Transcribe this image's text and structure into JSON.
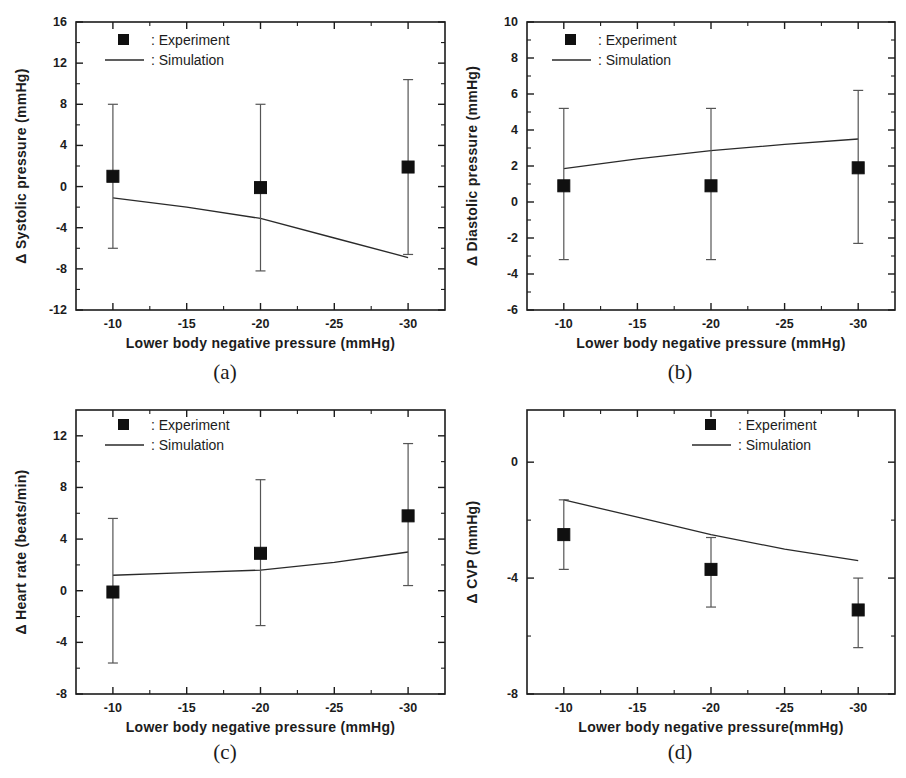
{
  "figure": {
    "width": 906,
    "height": 778,
    "background": "#ffffff",
    "ink_color": "#1c1c1c"
  },
  "legend": {
    "experiment_label": ": Experiment",
    "simulation_label": ": Simulation",
    "experiment_marker": "filled-square-marker",
    "simulation_marker": "solid-line-marker"
  },
  "captions": {
    "a": "(a)",
    "b": "(b)",
    "c": "(c)",
    "d": "(d)"
  },
  "chart_data": [
    {
      "id": "panel-a",
      "type": "scatter",
      "title": "",
      "caption": "(a)",
      "xlabel": "Lower body negative pressure (mmHg)",
      "ylabel": "Δ Systolic pressure (mmHg)",
      "x": [
        -10,
        -20,
        -30
      ],
      "xlim": [
        -7.5,
        -32.5
      ],
      "ylim": [
        -12,
        16
      ],
      "xticks": [
        -10,
        -15,
        -20,
        -25,
        -30
      ],
      "xticklabels": [
        "-10",
        "-15",
        "-20",
        "-25",
        "-30"
      ],
      "yticks": [
        -12,
        -8,
        -4,
        0,
        4,
        8,
        12,
        16
      ],
      "yticklabels": [
        "-12",
        "-8",
        "-4",
        "0",
        "4",
        "8",
        "12",
        "16"
      ],
      "y_minor_step": 2,
      "x_minor_step": 2.5,
      "grid": false,
      "legend_position": "top-left",
      "series": [
        {
          "name": "Experiment",
          "type": "scatter-errorbar",
          "values": [
            1.0,
            -0.1,
            1.9
          ],
          "err_low": [
            7.0,
            8.1,
            8.7
          ],
          "err_high": [
            7.0,
            8.1,
            8.5
          ],
          "lower": [
            -6.0,
            -8.2,
            -6.6
          ],
          "upper": [
            8.0,
            8.0,
            10.4
          ]
        },
        {
          "name": "Simulation",
          "type": "line",
          "x": [
            -10,
            -15,
            -20,
            -25,
            -30
          ],
          "values": [
            -1.1,
            -2.0,
            -3.1,
            -5.0,
            -6.9
          ]
        }
      ]
    },
    {
      "id": "panel-b",
      "type": "scatter",
      "title": "",
      "caption": "(b)",
      "xlabel": "Lower body negative pressure (mmHg)",
      "ylabel": "Δ Diastolic pressure (mmHg)",
      "x": [
        -10,
        -20,
        -30
      ],
      "xlim": [
        -7.5,
        -32.5
      ],
      "ylim": [
        -6,
        10
      ],
      "xticks": [
        -10,
        -15,
        -20,
        -25,
        -30
      ],
      "xticklabels": [
        "-10",
        "-15",
        "-20",
        "-25",
        "-30"
      ],
      "yticks": [
        -6,
        -4,
        -2,
        0,
        2,
        4,
        6,
        8,
        10
      ],
      "yticklabels": [
        "-6",
        "-4",
        "-2",
        "0",
        "2",
        "4",
        "6",
        "8",
        "10"
      ],
      "y_minor_step": 1,
      "x_minor_step": 2.5,
      "grid": false,
      "legend_position": "top-left",
      "series": [
        {
          "name": "Experiment",
          "type": "scatter-errorbar",
          "values": [
            0.9,
            0.9,
            1.9
          ],
          "err_low": [
            4.1,
            4.1,
            4.2
          ],
          "err_high": [
            4.3,
            4.3,
            4.3
          ],
          "lower": [
            -3.2,
            -3.2,
            -2.3
          ],
          "upper": [
            5.2,
            5.2,
            6.2
          ]
        },
        {
          "name": "Simulation",
          "type": "line",
          "x": [
            -10,
            -15,
            -20,
            -25,
            -30
          ],
          "values": [
            1.85,
            2.4,
            2.85,
            3.2,
            3.5
          ]
        }
      ]
    },
    {
      "id": "panel-c",
      "type": "scatter",
      "title": "",
      "caption": "(c)",
      "xlabel": "Lower body negative pressure (mmHg)",
      "ylabel": "Δ Heart rate (beats/min)",
      "x": [
        -10,
        -20,
        -30
      ],
      "xlim": [
        -7.5,
        -32.5
      ],
      "ylim": [
        -8,
        14
      ],
      "xticks": [
        -10,
        -15,
        -20,
        -25,
        -30
      ],
      "xticklabels": [
        "-10",
        "-15",
        "-20",
        "-25",
        "-30"
      ],
      "yticks": [
        -8,
        -4,
        0,
        4,
        8,
        12
      ],
      "yticklabels": [
        "-8",
        "-4",
        "0",
        "4",
        "8",
        "12"
      ],
      "y_minor_step": 2,
      "x_minor_step": 2.5,
      "grid": false,
      "legend_position": "top-left",
      "series": [
        {
          "name": "Experiment",
          "type": "scatter-errorbar",
          "values": [
            -0.1,
            2.9,
            5.8
          ],
          "err_low": [
            5.5,
            5.6,
            5.2
          ],
          "err_high": [
            5.7,
            5.7,
            5.5
          ],
          "lower": [
            -5.6,
            -2.7,
            0.4
          ],
          "upper": [
            5.6,
            8.6,
            11.4
          ]
        },
        {
          "name": "Simulation",
          "type": "line",
          "x": [
            -10,
            -15,
            -20,
            -25,
            -30
          ],
          "values": [
            1.2,
            1.4,
            1.6,
            2.2,
            3.0
          ]
        }
      ]
    },
    {
      "id": "panel-d",
      "type": "scatter",
      "title": "",
      "caption": "(d)",
      "xlabel": "Lower body negative pressure(mmHg)",
      "ylabel": "Δ CVP (mmHg)",
      "x": [
        -10,
        -20,
        -30
      ],
      "xlim": [
        -7.5,
        -32.5
      ],
      "ylim": [
        -8,
        1.8
      ],
      "xticks": [
        -10,
        -15,
        -20,
        -25,
        -30
      ],
      "xticklabels": [
        "-10",
        "-15",
        "-20",
        "-25",
        "-30"
      ],
      "yticks": [
        -8,
        -4,
        0
      ],
      "yticklabels": [
        "-8",
        "-4",
        "0"
      ],
      "y_minor_step": 2,
      "x_minor_step": 2.5,
      "grid": false,
      "legend_position": "top-right",
      "series": [
        {
          "name": "Experiment",
          "type": "scatter-errorbar",
          "values": [
            -2.5,
            -3.7,
            -5.1
          ],
          "err_low": [
            1.2,
            1.3,
            1.3
          ],
          "err_high": [
            1.2,
            1.1,
            1.1
          ],
          "lower": [
            -3.7,
            -5.0,
            -6.4
          ],
          "upper": [
            -1.3,
            -2.6,
            -4.0
          ]
        },
        {
          "name": "Simulation",
          "type": "line",
          "x": [
            -10,
            -15,
            -20,
            -25,
            -30
          ],
          "values": [
            -1.3,
            -1.9,
            -2.5,
            -3.0,
            -3.4
          ]
        }
      ]
    }
  ]
}
